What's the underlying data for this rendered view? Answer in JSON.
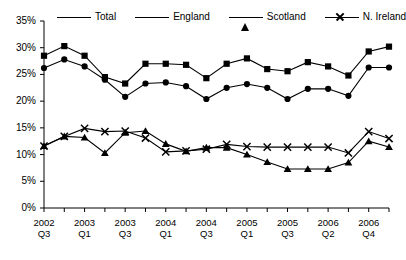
{
  "chart_data": {
    "type": "line",
    "title": "",
    "xlabel": "",
    "ylabel": "",
    "ylim": [
      0,
      35
    ],
    "ytick_labels": [
      "0%",
      "5%",
      "10%",
      "15%",
      "20%",
      "25%",
      "30%",
      "35%"
    ],
    "ytick_values": [
      0,
      5,
      10,
      15,
      20,
      25,
      30,
      35
    ],
    "grid": false,
    "legend_position": "top",
    "x": [
      "2002 Q3",
      "2002 Q4",
      "2003 Q1",
      "2003 Q2",
      "2003 Q3",
      "2003 Q4",
      "2004 Q1",
      "2004 Q2",
      "2004 Q3",
      "2004 Q4",
      "2005 Q1",
      "2005 Q2",
      "2005 Q3",
      "2005 Q4",
      "2006 Q1",
      "2006 Q2",
      "2006 Q3",
      "2006 Q4"
    ],
    "xtick_labels": [
      {
        "year": "2002",
        "quarter": "Q3"
      },
      {
        "year": "2003",
        "quarter": "Q1"
      },
      {
        "year": "2003",
        "quarter": "Q3"
      },
      {
        "year": "2004",
        "quarter": "Q1"
      },
      {
        "year": "2004",
        "quarter": "Q3"
      },
      {
        "year": "2005",
        "quarter": "Q1"
      },
      {
        "year": "2005",
        "quarter": "Q3"
      },
      {
        "year": "2006",
        "quarter": "Q2"
      },
      {
        "year": "2006",
        "quarter": "Q4"
      }
    ],
    "series": [
      {
        "name": "Total",
        "marker": "circle",
        "values": [
          26.2,
          27.8,
          26.5,
          24.0,
          20.8,
          23.3,
          23.5,
          22.8,
          20.4,
          22.5,
          23.2,
          22.5,
          20.4,
          22.3,
          22.3,
          21.0,
          26.3,
          26.3
        ]
      },
      {
        "name": "England",
        "marker": "square",
        "values": [
          28.5,
          30.3,
          28.5,
          24.5,
          23.3,
          27.0,
          27.0,
          26.8,
          24.3,
          27.0,
          28.0,
          26.0,
          25.6,
          27.3,
          26.5,
          24.8,
          29.3,
          30.2
        ]
      },
      {
        "name": "Scotland",
        "marker": "triangle",
        "values": [
          11.6,
          13.4,
          13.2,
          10.3,
          14.1,
          14.4,
          12.0,
          10.6,
          11.3,
          11.3,
          10.0,
          8.6,
          7.3,
          7.3,
          7.3,
          8.5,
          12.5,
          11.4
        ]
      },
      {
        "name": "N. Ireland",
        "marker": "x",
        "values": [
          11.6,
          13.4,
          14.9,
          14.3,
          14.4,
          13.1,
          10.5,
          10.7,
          11.0,
          11.9,
          11.5,
          11.4,
          11.4,
          11.4,
          11.4,
          10.3,
          14.3,
          13.0
        ]
      }
    ]
  },
  "legend": {
    "items": [
      {
        "label": "Total",
        "marker": "circle"
      },
      {
        "label": "England",
        "marker": "square"
      },
      {
        "label": "Scotland",
        "marker": "triangle"
      },
      {
        "label": "N. Ireland",
        "marker": "x"
      }
    ]
  }
}
